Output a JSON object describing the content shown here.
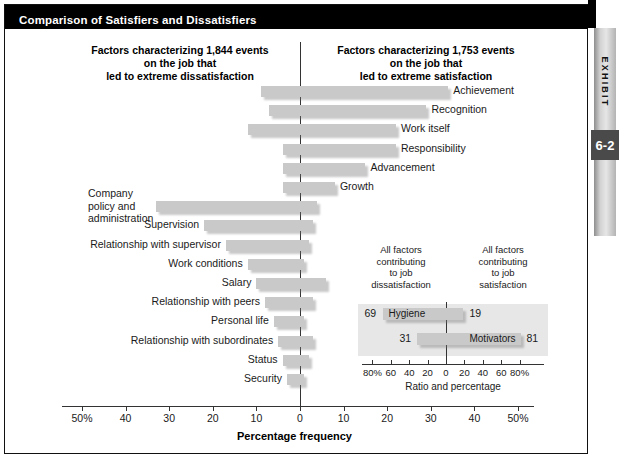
{
  "exhibit": {
    "title": "Comparison of Satisfiers and Dissatisfiers",
    "tab_word": "EXHIBIT",
    "tab_number": "6-2"
  },
  "headers": {
    "left": "Factors characterizing 1,844 events\non the job that\nled to extreme dissatisfaction",
    "right": "Factors characterizing 1,753 events\non the job that\nled to extreme satisfaction"
  },
  "axis": {
    "x_title": "Percentage frequency",
    "ticks": [
      "50%",
      "40",
      "30",
      "20",
      "10",
      "0",
      "10",
      "20",
      "30",
      "40",
      "50%"
    ],
    "tick_values": [
      -50,
      -40,
      -30,
      -20,
      -10,
      0,
      10,
      20,
      30,
      40,
      50
    ]
  },
  "inset": {
    "head_left": "All factors\ncontributing\nto job\ndissatisfaction",
    "head_right": "All factors\ncontributing\nto job\nsatisfaction",
    "x_title": "Ratio and percentage",
    "ticks": [
      "80%",
      "60",
      "40",
      "20",
      "0",
      "20",
      "40",
      "60",
      "80%"
    ],
    "tick_values": [
      -80,
      -60,
      -40,
      -20,
      0,
      20,
      40,
      60,
      80
    ],
    "rows": [
      {
        "label": "Hygiene",
        "left_value": 69,
        "right_value": 19,
        "left_text": "69",
        "right_text": "19"
      },
      {
        "label": "Motivators",
        "left_value": 31,
        "right_value": 81,
        "left_text": "31",
        "right_text": "81"
      }
    ]
  },
  "colors": {
    "bar": "#c9c9c9",
    "title_bar": "#000000",
    "inset_panel": "#e7e7e7",
    "tab_number": "#4a4a4a"
  },
  "chart_data": {
    "type": "bar",
    "title": "Comparison of Satisfiers and Dissatisfiers",
    "subtitle": "Herzberg two-factor theory: factors characterizing 1,844 events leading to extreme dissatisfaction and 1,753 events leading to extreme satisfaction",
    "orientation": "horizontal-diverging",
    "xlabel": "Percentage frequency",
    "ylabel": "",
    "xlim": [
      -50,
      50
    ],
    "grid": false,
    "legend": "none",
    "series": [
      {
        "name": "Percentage frequency — dissatisfaction (left of zero)",
        "side": "left"
      },
      {
        "name": "Percentage frequency — satisfaction (right of zero)",
        "side": "right"
      }
    ],
    "categories": [
      "Achievement",
      "Recognition",
      "Work itself",
      "Responsibility",
      "Advancement",
      "Growth",
      "Company policy and administration",
      "Supervision",
      "Relationship with supervisor",
      "Work conditions",
      "Salary",
      "Relationship with peers",
      "Personal life",
      "Relationship with subordinates",
      "Status",
      "Security"
    ],
    "points": [
      {
        "label": "Achievement",
        "group": "motivator",
        "dissatisfaction": 9,
        "satisfaction": 34,
        "label_side": "right"
      },
      {
        "label": "Recognition",
        "group": "motivator",
        "dissatisfaction": 7,
        "satisfaction": 29,
        "label_side": "right"
      },
      {
        "label": "Work itself",
        "group": "motivator",
        "dissatisfaction": 12,
        "satisfaction": 22,
        "label_side": "right"
      },
      {
        "label": "Responsibility",
        "group": "motivator",
        "dissatisfaction": 4,
        "satisfaction": 22,
        "label_side": "right"
      },
      {
        "label": "Advancement",
        "group": "motivator",
        "dissatisfaction": 4,
        "satisfaction": 15,
        "label_side": "right"
      },
      {
        "label": "Growth",
        "group": "motivator",
        "dissatisfaction": 4,
        "satisfaction": 8,
        "label_side": "right"
      },
      {
        "label": "Company policy and administration",
        "group": "hygiene",
        "dissatisfaction": 33,
        "satisfaction": 4,
        "label_side": "left"
      },
      {
        "label": "Supervision",
        "group": "hygiene",
        "dissatisfaction": 22,
        "satisfaction": 3,
        "label_side": "left"
      },
      {
        "label": "Relationship with supervisor",
        "group": "hygiene",
        "dissatisfaction": 17,
        "satisfaction": 2,
        "label_side": "left"
      },
      {
        "label": "Work conditions",
        "group": "hygiene",
        "dissatisfaction": 12,
        "satisfaction": 1,
        "label_side": "left"
      },
      {
        "label": "Salary",
        "group": "hygiene",
        "dissatisfaction": 10,
        "satisfaction": 6,
        "label_side": "left"
      },
      {
        "label": "Relationship with peers",
        "group": "hygiene",
        "dissatisfaction": 8,
        "satisfaction": 3,
        "label_side": "left"
      },
      {
        "label": "Personal life",
        "group": "hygiene",
        "dissatisfaction": 6,
        "satisfaction": 1,
        "label_side": "left"
      },
      {
        "label": "Relationship with subordinates",
        "group": "hygiene",
        "dissatisfaction": 5,
        "satisfaction": 3,
        "label_side": "left"
      },
      {
        "label": "Status",
        "group": "hygiene",
        "dissatisfaction": 4,
        "satisfaction": 2,
        "label_side": "left"
      },
      {
        "label": "Security",
        "group": "hygiene",
        "dissatisfaction": 3,
        "satisfaction": 1,
        "label_side": "left"
      }
    ]
  }
}
